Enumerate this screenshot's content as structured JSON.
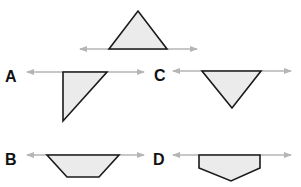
{
  "colors": {
    "shape_fill": "#ebebeb",
    "shape_stroke": "#1a1a1a",
    "axis_line": "#b5b5b5",
    "label": "#111111"
  },
  "original": {
    "name": "original-triangle",
    "axis": {
      "x1": 80,
      "x2": 197,
      "y": 49
    },
    "points": "109,49 138,11 167,49"
  },
  "options": [
    {
      "label": "A",
      "label_x": 5,
      "label_y": 69,
      "axis": {
        "x1": 27,
        "x2": 144,
        "y": 72
      },
      "points": "63,72 107,72 63,121"
    },
    {
      "label": "C",
      "label_x": 154,
      "label_y": 68,
      "axis": {
        "x1": 173,
        "x2": 291,
        "y": 71
      },
      "points": "202,71 261,71 232,108"
    },
    {
      "label": "B",
      "label_x": 5,
      "label_y": 152,
      "axis": {
        "x1": 27,
        "x2": 144,
        "y": 155
      },
      "points": "47,155 119,155 99,177 67,177"
    },
    {
      "label": "D",
      "label_x": 153,
      "label_y": 152,
      "axis": {
        "x1": 173,
        "x2": 291,
        "y": 155
      },
      "points": "199,155 260,155 260,168 231,181 199,168"
    }
  ]
}
